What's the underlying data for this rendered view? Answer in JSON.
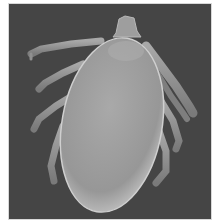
{
  "image": {
    "subject": "Scanning electron micrograph of a tick (dorsal view)",
    "background_color": "#444444",
    "border_color": "#d8d8d8",
    "body_color": "#9a9a9a",
    "body_highlight": "#c2c2c2",
    "leg_color": "#8c8c8c",
    "legs_visible": 8
  }
}
